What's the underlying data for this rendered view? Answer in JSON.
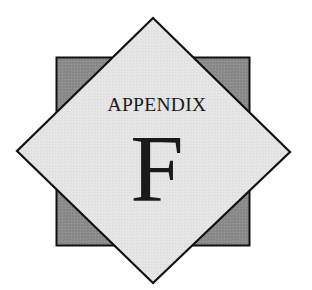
{
  "emblem": {
    "heading": "APPENDIX",
    "letter": "F",
    "colors": {
      "background": "#ffffff",
      "square_fill": "#8c8c8c",
      "diamond_fill": "#e4e4e4",
      "outline": "#111111",
      "text": "#1a1a1a"
    }
  }
}
